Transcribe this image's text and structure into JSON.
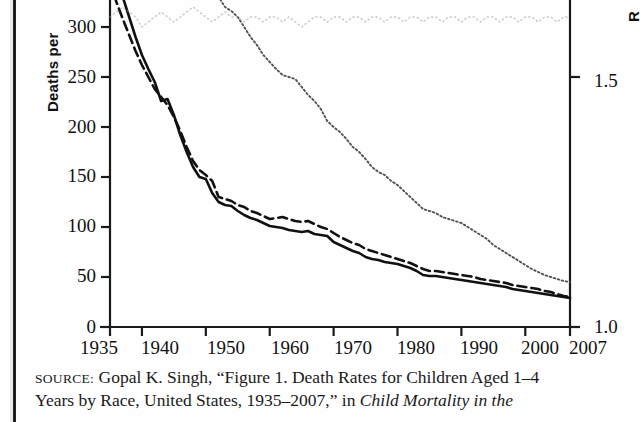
{
  "figure": {
    "y_axis_label": "Deaths per",
    "right_axis_label": "R",
    "y_ticks": [
      "300",
      "250",
      "200",
      "150",
      "100",
      "50",
      "0"
    ],
    "right_ticks": [
      "1.5",
      "1.0"
    ],
    "x_ticks": [
      "1935",
      "1940",
      "1950",
      "1960",
      "1970",
      "1980",
      "1990",
      "2000",
      "2007"
    ]
  },
  "source": {
    "label": "SOURCE:",
    "line1": " Gopal K. Singh, “Figure 1. Death Rates for Children Aged 1–4",
    "line2a": "Years by Race, United States, 1935–2007,” in ",
    "line2b": "Child Mortality in the"
  },
  "chart_data": {
    "type": "line",
    "xlabel": "",
    "ylabel": "Deaths per",
    "y2label": "R",
    "xlim": [
      1935,
      2007
    ],
    "ylim": [
      0,
      325
    ],
    "y2lim": [
      1.0,
      1.6
    ],
    "grid": false,
    "legend": "none",
    "y_ticks": [
      0,
      50,
      100,
      150,
      200,
      250,
      300
    ],
    "y2_ticks": [
      1.0,
      1.5
    ],
    "x_ticks": [
      1935,
      1940,
      1950,
      1960,
      1970,
      1980,
      1990,
      2000,
      2007
    ],
    "x": [
      1935,
      1936,
      1937,
      1938,
      1939,
      1940,
      1941,
      1942,
      1943,
      1944,
      1945,
      1946,
      1947,
      1948,
      1949,
      1950,
      1951,
      1952,
      1953,
      1954,
      1955,
      1956,
      1957,
      1958,
      1959,
      1960,
      1961,
      1962,
      1963,
      1964,
      1965,
      1966,
      1967,
      1968,
      1969,
      1970,
      1971,
      1972,
      1973,
      1974,
      1975,
      1976,
      1977,
      1978,
      1979,
      1980,
      1981,
      1982,
      1983,
      1984,
      1985,
      1986,
      1987,
      1988,
      1989,
      1990,
      1991,
      1992,
      1993,
      1994,
      1995,
      1996,
      1997,
      1998,
      1999,
      2000,
      2001,
      2002,
      2003,
      2004,
      2005,
      2006,
      2007
    ],
    "series": [
      {
        "name": "Total (solid)",
        "style": "solid",
        "values": [
          375,
          350,
          330,
          310,
          290,
          272,
          258,
          245,
          226,
          228,
          212,
          192,
          175,
          160,
          150,
          148,
          134,
          125,
          122,
          121,
          116,
          112,
          109,
          107,
          104,
          101,
          100,
          99,
          97,
          96,
          95,
          96,
          93,
          92,
          91,
          85,
          82,
          79,
          76,
          74,
          70,
          68,
          67,
          65,
          64,
          63,
          61,
          59,
          56,
          52,
          51,
          51,
          50,
          49,
          48,
          47,
          46,
          45,
          44,
          43,
          42,
          41,
          40,
          38,
          37,
          36,
          35,
          34,
          33,
          32,
          31,
          30,
          29
        ]
      },
      {
        "name": "White (dashed)",
        "style": "dashed",
        "values": [
          345,
          325,
          308,
          292,
          276,
          262,
          250,
          238,
          230,
          222,
          210,
          196,
          180,
          166,
          157,
          152,
          146,
          130,
          128,
          126,
          122,
          120,
          116,
          114,
          111,
          108,
          109,
          110,
          108,
          106,
          105,
          106,
          103,
          100,
          98,
          94,
          90,
          87,
          84,
          82,
          78,
          76,
          74,
          72,
          70,
          68,
          66,
          64,
          61,
          58,
          56,
          56,
          55,
          54,
          53,
          52,
          51,
          50,
          48,
          47,
          46,
          45,
          44,
          42,
          41,
          40,
          39,
          38,
          36,
          35,
          33,
          31,
          30
        ]
      },
      {
        "name": "Black / Other (dotted)",
        "style": "dotted",
        "values": [
          900,
          860,
          820,
          790,
          760,
          720,
          680,
          640,
          600,
          560,
          520,
          480,
          450,
          420,
          395,
          370,
          345,
          330,
          320,
          316,
          310,
          300,
          290,
          282,
          272,
          265,
          258,
          252,
          250,
          248,
          240,
          232,
          226,
          218,
          206,
          200,
          195,
          188,
          180,
          175,
          168,
          160,
          155,
          152,
          146,
          142,
          136,
          130,
          124,
          118,
          116,
          114,
          110,
          108,
          106,
          104,
          100,
          96,
          92,
          88,
          82,
          78,
          74,
          70,
          66,
          62,
          58,
          55,
          52,
          50,
          48,
          46,
          45
        ]
      },
      {
        "name": "Rate ratio (faint dotted, right axis)",
        "style": "faint-dotted",
        "axis": "right",
        "values": [
          1.62,
          1.63,
          1.64,
          1.63,
          1.62,
          1.6,
          1.61,
          1.62,
          1.63,
          1.62,
          1.61,
          1.62,
          1.63,
          1.64,
          1.63,
          1.62,
          1.61,
          1.62,
          1.63,
          1.62,
          1.62,
          1.61,
          1.62,
          1.62,
          1.61,
          1.62,
          1.62,
          1.61,
          1.62,
          1.61,
          1.6,
          1.61,
          1.62,
          1.62,
          1.61,
          1.62,
          1.62,
          1.61,
          1.62,
          1.62,
          1.61,
          1.62,
          1.62,
          1.61,
          1.62,
          1.62,
          1.61,
          1.62,
          1.62,
          1.61,
          1.62,
          1.62,
          1.61,
          1.62,
          1.62,
          1.61,
          1.62,
          1.62,
          1.61,
          1.62,
          1.62,
          1.61,
          1.62,
          1.62,
          1.61,
          1.62,
          1.62,
          1.61,
          1.62,
          1.62,
          1.61,
          1.62,
          1.62
        ]
      }
    ]
  }
}
